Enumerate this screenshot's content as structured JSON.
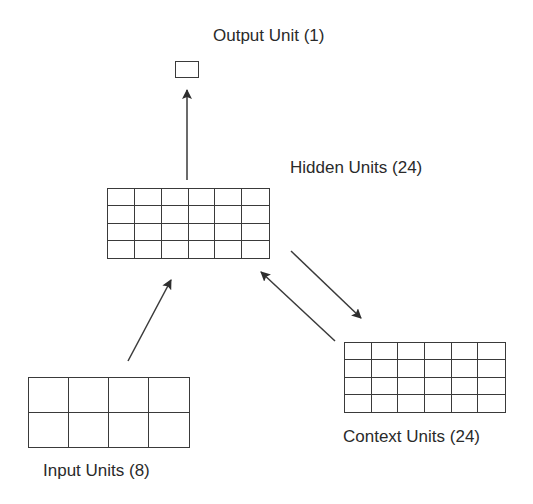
{
  "diagram": {
    "nodes": {
      "output": {
        "label": "Output Unit (1)",
        "units": 1,
        "rows": 1,
        "cols": 1
      },
      "hidden": {
        "label": "Hidden Units (24)",
        "units": 24,
        "rows": 4,
        "cols": 6
      },
      "context": {
        "label": "Context Units (24)",
        "units": 24,
        "rows": 4,
        "cols": 6
      },
      "input": {
        "label": "Input Units (8)",
        "units": 8,
        "rows": 2,
        "cols": 4
      }
    },
    "edges": [
      {
        "from": "input",
        "to": "hidden"
      },
      {
        "from": "hidden",
        "to": "output"
      },
      {
        "from": "hidden",
        "to": "context"
      },
      {
        "from": "context",
        "to": "hidden"
      }
    ],
    "colors": {
      "line": "#3a3a3a",
      "text": "#2a2a2a",
      "background": "#ffffff"
    }
  }
}
